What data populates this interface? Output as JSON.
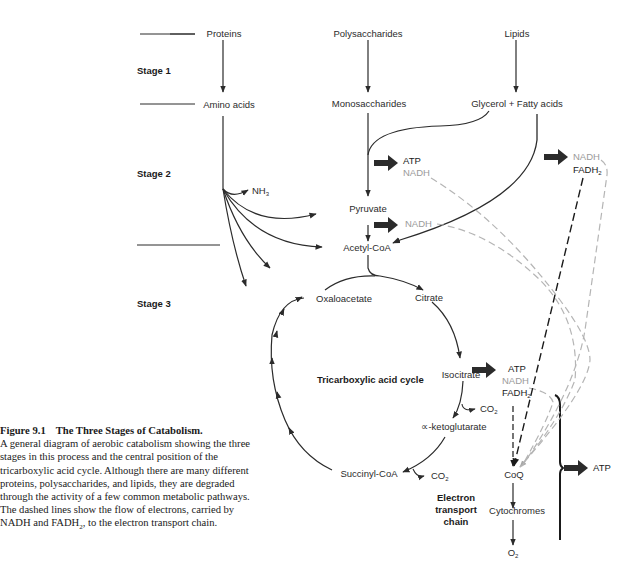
{
  "stages": {
    "stage1": "Stage 1",
    "stage2": "Stage 2",
    "stage3": "Stage 3"
  },
  "sources": {
    "proteins": "Proteins",
    "polysaccharides": "Polysaccharides",
    "lipids": "Lipids"
  },
  "monomers": {
    "amino_acids": "Amino acids",
    "monosaccharides": "Monosaccharides",
    "glycerol_fatty_acids": "Glycerol + Fatty acids"
  },
  "stage2_products": {
    "nh3_base": "NH",
    "nh3_sub": "3",
    "glycolysis_atp": "ATP",
    "glycolysis_nadh": "NADH",
    "pyruvate": "Pyruvate",
    "pyruvate_nadh": "NADH",
    "acetyl_coa": "Acetyl-CoA",
    "lipid_nadh": "NADH",
    "lipid_fadh2_base": "FADH",
    "lipid_fadh2_sub": "2"
  },
  "tca_cycle": {
    "title": "Tricarboxylic acid cycle",
    "oxaloacetate": "Oxaloacetate",
    "citrate": "Citrate",
    "isocitrate": "Isocitrate",
    "co2_1_base": "CO",
    "co2_1_sub": "2",
    "alpha_ketoglutarate": "∝-ketoglutarate",
    "succinyl_coa": "Succinyl-CoA",
    "co2_2_base": "CO",
    "co2_2_sub": "2",
    "atp": "ATP",
    "nadh": "NADH",
    "fadh2_base": "FADH",
    "fadh2_sub": "2"
  },
  "electron_transport": {
    "title_line1": "Electron",
    "title_line2": "transport",
    "title_line3": "chain",
    "coq": "CoQ",
    "cytochromes": "Cytochromes",
    "o2_base": "O",
    "o2_sub": "2",
    "atp": "ATP"
  },
  "caption": {
    "number": "Figure 9.1",
    "title": "The Three Stages of Catabolism.",
    "body": "A general diagram of aerobic catabolism showing the three stages in this process and the central position of the tricarboxylic acid cycle. Although there are many different proteins, polysaccharides, and lipids, they are degraded through the activity of a few common metabolic pathways. The dashed lines show the flow of electrons, carried by NADH and FADH",
    "body_sub": "2",
    "body_end": ", to the electron transport chain."
  },
  "colors": {
    "line": "#2b2b2b",
    "grey_text": "#9a9a9a",
    "dashed_grey": "#b5b5b5",
    "dashed_black": "#1a1a1a"
  }
}
